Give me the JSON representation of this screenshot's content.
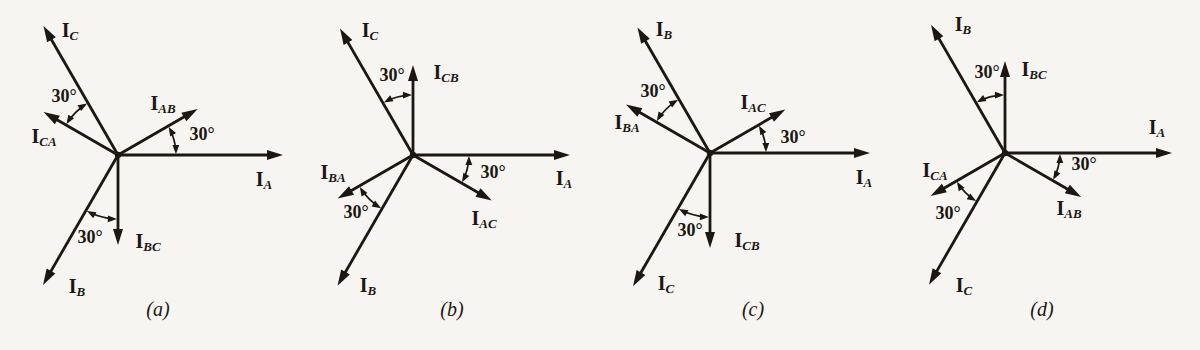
{
  "figure": {
    "type": "three-phase current phasor diagrams",
    "background_color": "#f7f5f1",
    "ink_color": "#1b1813",
    "panels": [
      {
        "caption": "(a)",
        "caption_pos": {
          "x": 158,
          "y": 312
        },
        "origin": {
          "x": 118,
          "y": 155
        },
        "vectors": [
          {
            "main": "I",
            "sub": "A",
            "angle": 0,
            "length": 165,
            "label_pos": {
              "x": 264,
              "y": 181
            }
          },
          {
            "main": "I",
            "sub": "C",
            "angle": 120,
            "length": 149,
            "label_pos": {
              "x": 70,
              "y": 32
            }
          },
          {
            "main": "I",
            "sub": "B",
            "angle": 240,
            "length": 150,
            "label_pos": {
              "x": 77,
              "y": 288
            }
          },
          {
            "main": "I",
            "sub": "AB",
            "angle": 30,
            "length": 92,
            "label_pos": {
              "x": 163,
              "y": 105
            }
          },
          {
            "main": "I",
            "sub": "CA",
            "angle": 150,
            "length": 86,
            "label_pos": {
              "x": 44,
              "y": 138
            }
          },
          {
            "main": "I",
            "sub": "BC",
            "angle": 270,
            "length": 90,
            "label_pos": {
              "x": 148,
              "y": 243
            }
          }
        ],
        "arcs": [
          {
            "from": 0,
            "to": 30,
            "radius": 58,
            "label": "30°",
            "label_pos": {
              "x": 202,
              "y": 136
            }
          },
          {
            "from": 120,
            "to": 150,
            "radius": 60,
            "label": "30°",
            "label_pos": {
              "x": 64,
              "y": 98
            }
          },
          {
            "from": 240,
            "to": 270,
            "radius": 64,
            "label": "30°",
            "label_pos": {
              "x": 90,
              "y": 239
            }
          }
        ]
      },
      {
        "caption": "(b)",
        "caption_pos": {
          "x": 152,
          "y": 312
        },
        "origin": {
          "x": 113,
          "y": 155
        },
        "vectors": [
          {
            "main": "I",
            "sub": "A",
            "angle": 0,
            "length": 157,
            "label_pos": {
              "x": 264,
              "y": 180
            }
          },
          {
            "main": "I",
            "sub": "C",
            "angle": 120,
            "length": 146,
            "label_pos": {
              "x": 70,
              "y": 32
            }
          },
          {
            "main": "I",
            "sub": "B",
            "angle": 240,
            "length": 151,
            "label_pos": {
              "x": 68,
              "y": 287
            }
          },
          {
            "main": "I",
            "sub": "CB",
            "angle": 90,
            "length": 90,
            "label_pos": {
              "x": 146,
              "y": 74
            }
          },
          {
            "main": "I",
            "sub": "BA",
            "angle": 210,
            "length": 87,
            "label_pos": {
              "x": 33,
              "y": 174
            }
          },
          {
            "main": "I",
            "sub": "AC",
            "angle": 330,
            "length": 91,
            "label_pos": {
              "x": 184,
              "y": 220
            }
          }
        ],
        "arcs": [
          {
            "from": 330,
            "to": 360,
            "radius": 56,
            "label": "30°",
            "label_pos": {
              "x": 193,
              "y": 174
            }
          },
          {
            "from": 90,
            "to": 120,
            "radius": 60,
            "label": "30°",
            "label_pos": {
              "x": 92,
              "y": 77
            }
          },
          {
            "from": 210,
            "to": 240,
            "radius": 62,
            "label": "30°",
            "label_pos": {
              "x": 56,
              "y": 214
            }
          }
        ]
      },
      {
        "caption": "(c)",
        "caption_pos": {
          "x": 153,
          "y": 312
        },
        "origin": {
          "x": 110,
          "y": 153
        },
        "vectors": [
          {
            "main": "I",
            "sub": "A",
            "angle": 0,
            "length": 160,
            "label_pos": {
              "x": 264,
              "y": 179
            }
          },
          {
            "main": "I",
            "sub": "B",
            "angle": 120,
            "length": 145,
            "label_pos": {
              "x": 64,
              "y": 31
            }
          },
          {
            "main": "I",
            "sub": "C",
            "angle": 240,
            "length": 154,
            "label_pos": {
              "x": 66,
              "y": 285
            }
          },
          {
            "main": "I",
            "sub": "AC",
            "angle": 30,
            "length": 87,
            "label_pos": {
              "x": 153,
              "y": 104
            }
          },
          {
            "main": "I",
            "sub": "BA",
            "angle": 150,
            "length": 97,
            "label_pos": {
              "x": 27,
              "y": 124
            }
          },
          {
            "main": "I",
            "sub": "CB",
            "angle": 270,
            "length": 95,
            "label_pos": {
              "x": 147,
              "y": 242
            }
          }
        ],
        "arcs": [
          {
            "from": 0,
            "to": 30,
            "radius": 56,
            "label": "30°",
            "label_pos": {
              "x": 193,
              "y": 139
            }
          },
          {
            "from": 120,
            "to": 150,
            "radius": 62,
            "label": "30°",
            "label_pos": {
              "x": 53,
              "y": 93
            }
          },
          {
            "from": 240,
            "to": 270,
            "radius": 64,
            "label": "30°",
            "label_pos": {
              "x": 90,
              "y": 232
            }
          }
        ]
      },
      {
        "caption": "(d)",
        "caption_pos": {
          "x": 142,
          "y": 312
        },
        "origin": {
          "x": 105,
          "y": 153
        },
        "vectors": [
          {
            "main": "I",
            "sub": "A",
            "angle": 0,
            "length": 167,
            "label_pos": {
              "x": 257,
              "y": 129
            }
          },
          {
            "main": "I",
            "sub": "B",
            "angle": 120,
            "length": 148,
            "label_pos": {
              "x": 63,
              "y": 26
            }
          },
          {
            "main": "I",
            "sub": "C",
            "angle": 240,
            "length": 152,
            "label_pos": {
              "x": 64,
              "y": 287
            }
          },
          {
            "main": "I",
            "sub": "BC",
            "angle": 90,
            "length": 92,
            "label_pos": {
              "x": 134,
              "y": 71
            }
          },
          {
            "main": "I",
            "sub": "CA",
            "angle": 210,
            "length": 86,
            "label_pos": {
              "x": 35,
              "y": 172
            }
          },
          {
            "main": "I",
            "sub": "AB",
            "angle": 330,
            "length": 88,
            "label_pos": {
              "x": 169,
              "y": 210
            }
          }
        ],
        "arcs": [
          {
            "from": 330,
            "to": 360,
            "radius": 55,
            "label": "30°",
            "label_pos": {
              "x": 184,
              "y": 166
            }
          },
          {
            "from": 90,
            "to": 120,
            "radius": 58,
            "label": "30°",
            "label_pos": {
              "x": 87,
              "y": 74
            }
          },
          {
            "from": 210,
            "to": 240,
            "radius": 56,
            "label": "30°",
            "label_pos": {
              "x": 48,
              "y": 215
            }
          }
        ]
      }
    ]
  }
}
